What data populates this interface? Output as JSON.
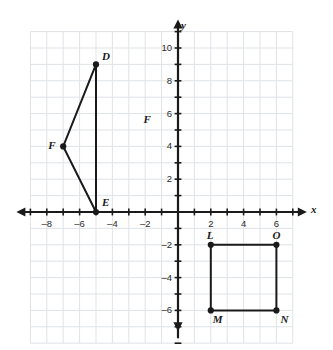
{
  "figure": {
    "title": "",
    "background_color": "#ffffff",
    "grid_color": "#dfe3e6",
    "axis_color": "#1a1a1a",
    "shape_color": "#1a1a1a"
  },
  "chart_data": {
    "type": "scatter",
    "title": "",
    "xlabel": "x",
    "ylabel": "y",
    "xlim": [
      -9,
      7
    ],
    "ylim": [
      -8,
      11
    ],
    "grid": true,
    "legend": "none",
    "x_ticks": [
      -8,
      -6,
      -4,
      -2,
      2,
      4,
      6
    ],
    "x_tick_labels": [
      "–8",
      "–6",
      "–4",
      "–2",
      "2",
      "4",
      "6"
    ],
    "y_ticks": [
      10,
      8,
      6,
      4,
      2,
      -2,
      -4,
      -6
    ],
    "y_tick_labels": [
      "10",
      "8",
      "6",
      "4",
      "2",
      "–2",
      "–4",
      "–6"
    ],
    "x_minor_ticks": [
      -9,
      -7,
      -5,
      -3,
      -1,
      1,
      3,
      5,
      7
    ],
    "y_minor_ticks": [
      11,
      9,
      7,
      5,
      3,
      1,
      -1,
      -3,
      -5,
      -7
    ],
    "series": [
      {
        "name": "triangle-def",
        "kind": "polygon",
        "closed": true,
        "points": [
          {
            "label": "D",
            "x": -5,
            "y": 9,
            "label_dx": 6,
            "label_dy": -14
          },
          {
            "label": "E",
            "x": -5,
            "y": 0,
            "label_dx": 6,
            "label_dy": -16
          },
          {
            "label": "F",
            "x": -7,
            "y": 4,
            "label_dx": -15,
            "label_dy": -7
          }
        ]
      },
      {
        "name": "square-lmno",
        "kind": "polygon",
        "closed": true,
        "points": [
          {
            "label": "L",
            "x": 2,
            "y": -2,
            "label_dx": -4,
            "label_dy": -16
          },
          {
            "label": "O",
            "x": 6,
            "y": -2,
            "label_dx": -4,
            "label_dy": -16
          },
          {
            "label": "N",
            "x": 6,
            "y": -6,
            "label_dx": 4,
            "label_dy": 3
          },
          {
            "label": "M",
            "x": 2,
            "y": -6,
            "label_dx": 2,
            "label_dy": 3
          }
        ]
      }
    ],
    "annotations": [
      {
        "name": "stray-f-label",
        "text": "F",
        "x": -2.1,
        "y": 5.6
      }
    ]
  },
  "axis_titles": {
    "x": "x",
    "y": "y"
  }
}
